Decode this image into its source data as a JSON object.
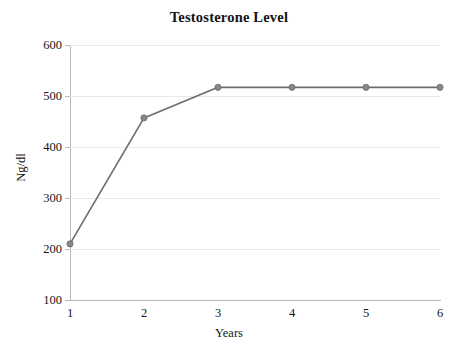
{
  "chart_data": {
    "type": "line",
    "title": "Testosterone Level",
    "xlabel": "Years",
    "ylabel": "Ng/dl",
    "x": [
      1,
      2,
      3,
      4,
      5,
      6
    ],
    "xtick_labels": [
      "1",
      "2",
      "3",
      "4",
      "5",
      "6"
    ],
    "ytick_labels": [
      "100",
      "200",
      "300",
      "400",
      "500",
      "600"
    ],
    "yticks": [
      100,
      200,
      300,
      400,
      500,
      600
    ],
    "values": [
      210,
      457,
      517,
      517,
      517,
      517
    ],
    "series": [
      {
        "name": "Testosterone Level",
        "values": [
          210,
          457,
          517,
          517,
          517,
          517
        ]
      }
    ],
    "xlim": [
      1,
      6
    ],
    "ylim": [
      100,
      600
    ],
    "grid": "horizontal",
    "legend": "none",
    "line_color": "#6b6b70",
    "marker_color": "#86868b",
    "gridline_color": "#e9e9ea",
    "axis_color": "#b9b9bb",
    "background_color": "#ffffff",
    "text_color": "#171717"
  }
}
